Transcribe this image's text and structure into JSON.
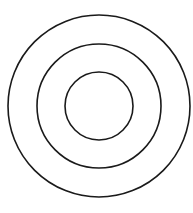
{
  "diagram": {
    "type": "concentric-circles",
    "background": "#ffffff",
    "stroke_color": "#1a1a1a",
    "stroke_width": 1.6,
    "center": {
      "cx": 99,
      "cy": 106
    },
    "circles": [
      {
        "name": "outer",
        "r": 91
      },
      {
        "name": "middle",
        "r": 62
      },
      {
        "name": "inner",
        "r": 34
      }
    ]
  }
}
